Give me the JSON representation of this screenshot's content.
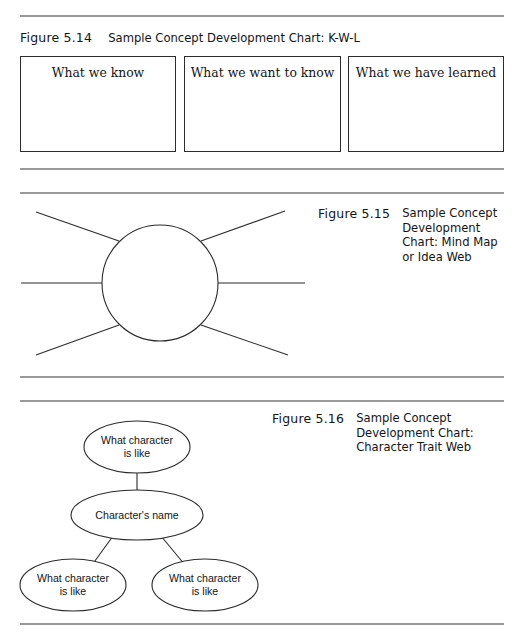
{
  "page": {
    "background": "#ffffff",
    "rule_color": "#9a9a9a",
    "ink_color": "#2b2b2b"
  },
  "rules": [
    {
      "name": "rule-top",
      "y": 15
    },
    {
      "name": "rule-fig514-bottom",
      "y": 168
    },
    {
      "name": "rule-fig515-top",
      "y": 192
    },
    {
      "name": "rule-fig515-bottom",
      "y": 376
    },
    {
      "name": "rule-fig516-top",
      "y": 400
    },
    {
      "name": "rule-bottom",
      "y": 623
    }
  ],
  "figures": [
    {
      "id": "figure-5-14",
      "number": "Figure 5.14",
      "title": "Sample Concept Development Chart: K-W-L",
      "boxes": [
        {
          "label": "What we know"
        },
        {
          "label": "What we want to know"
        },
        {
          "label": "What we have learned"
        }
      ]
    },
    {
      "id": "figure-5-15",
      "number": "Figure 5.15",
      "title": "Sample Concept\nDevelopment\nChart: Mind Map\nor Idea Web"
    },
    {
      "id": "figure-5-16",
      "number": "Figure 5.16",
      "title": "Sample Concept\nDevelopment Chart:\nCharacter Trait Web",
      "nodes": [
        {
          "name": "trait-top",
          "line1": "What character",
          "line2": "is like"
        },
        {
          "name": "character-name",
          "line1": "Character's name",
          "line2": ""
        },
        {
          "name": "trait-bottom-left",
          "line1": "What character",
          "line2": "is like"
        },
        {
          "name": "trait-bottom-right",
          "line1": "What character",
          "line2": "is like"
        }
      ]
    }
  ],
  "chart_data": [
    {
      "type": "table",
      "title": "Sample Concept Development Chart: K-W-L",
      "columns": [
        "What we know",
        "What we want to know",
        "What we have learned"
      ],
      "rows": [],
      "note": "Three empty columns for student entries"
    },
    {
      "type": "diagram",
      "subtype": "mind-map",
      "title": "Sample Concept Development Chart: Mind Map or Idea Web",
      "center": {
        "shape": "circle",
        "label": "",
        "cx": 160,
        "cy": 283,
        "r": 58
      },
      "spokes": 6,
      "spoke_endpoints": [
        {
          "x": 36,
          "y": 212
        },
        {
          "x": 285,
          "y": 211
        },
        {
          "x": 21,
          "y": 283
        },
        {
          "x": 305,
          "y": 283
        },
        {
          "x": 36,
          "y": 355
        },
        {
          "x": 288,
          "y": 355
        }
      ]
    },
    {
      "type": "diagram",
      "subtype": "character-trait-web",
      "title": "Sample Concept Development Chart: Character Trait Web",
      "nodes": [
        {
          "id": "top",
          "label": "What character is like",
          "cx": 137,
          "cy": 447,
          "rx": 53,
          "ry": 26
        },
        {
          "id": "center",
          "label": "Character's name",
          "cx": 137,
          "cy": 515,
          "rx": 66,
          "ry": 25
        },
        {
          "id": "bottom-left",
          "label": "What character is like",
          "cx": 73,
          "cy": 585,
          "rx": 53,
          "ry": 26
        },
        {
          "id": "bottom-right",
          "label": "What character is like",
          "cx": 205,
          "cy": 585,
          "rx": 53,
          "ry": 26
        }
      ],
      "edges": [
        {
          "from": "center",
          "to": "top"
        },
        {
          "from": "center",
          "to": "bottom-left"
        },
        {
          "from": "center",
          "to": "bottom-right"
        }
      ]
    }
  ]
}
